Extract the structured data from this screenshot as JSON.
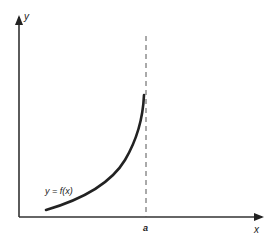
{
  "diagram": {
    "axes": {
      "x_label": "x",
      "y_label": "y"
    },
    "curve": {
      "label": "y = f(x)",
      "description": "increasing convex curve approaching a vertical asymptote at x = a"
    },
    "asymptote": {
      "label": "a",
      "style": "dashed vertical line"
    },
    "colors": {
      "ink": "#222222",
      "dash": "#555555",
      "background": "#ffffff"
    }
  }
}
